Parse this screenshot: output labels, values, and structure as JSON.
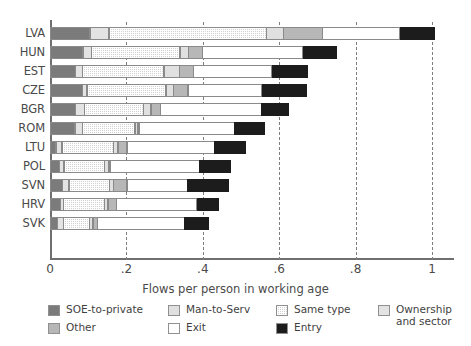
{
  "chart_data": {
    "type": "bar",
    "orientation": "horizontal",
    "stacked": true,
    "title": "",
    "xlabel": "Flows per person in working age",
    "ylabel": "",
    "xlim": [
      0,
      1.07
    ],
    "xticks": [
      0,
      0.2,
      0.4,
      0.6,
      0.8,
      1
    ],
    "xtick_labels": [
      "0",
      ".2",
      ".4",
      ".6",
      ".8",
      "1"
    ],
    "grid": "vertical-dashed",
    "legend_position": "below",
    "categories": [
      "LVA",
      "HUN",
      "EST",
      "CZE",
      "BGR",
      "ROM",
      "LTU",
      "POL",
      "SVN",
      "HRV",
      "SVK"
    ],
    "series": [
      {
        "name": "SOE-to-private",
        "color": "#7b7b7b",
        "values": [
          0.105,
          0.087,
          0.068,
          0.086,
          0.068,
          0.066,
          0.016,
          0.026,
          0.034,
          0.029,
          0.021
        ]
      },
      {
        "name": "Ownership and sector",
        "color": "#e3e3e3",
        "values": [
          0.052,
          0.024,
          0.019,
          0.013,
          0.024,
          0.021,
          0.018,
          0.013,
          0.018,
          0.008,
          0.016
        ]
      },
      {
        "name": "Same type",
        "color": "#d2d2d2",
        "values": [
          0.414,
          0.233,
          0.215,
          0.209,
          0.157,
          0.139,
          0.136,
          0.107,
          0.107,
          0.11,
          0.071
        ]
      },
      {
        "name": "Man-to-Serv",
        "color": "#e0e0e0",
        "values": [
          0.045,
          0.024,
          0.042,
          0.021,
          0.021,
          0.01,
          0.013,
          0.013,
          0.013,
          0.01,
          0.01
        ]
      },
      {
        "name": "Other",
        "color": "#b7b7b7",
        "values": [
          0.105,
          0.039,
          0.039,
          0.039,
          0.026,
          0.005,
          0.026,
          0.005,
          0.037,
          0.024,
          0.013
        ]
      },
      {
        "name": "Exit",
        "color": "#ffffff",
        "values": [
          0.204,
          0.264,
          0.207,
          0.196,
          0.267,
          0.251,
          0.23,
          0.236,
          0.16,
          0.212,
          0.23
        ]
      },
      {
        "name": "Entry",
        "color": "#1c1c1c",
        "values": [
          0.092,
          0.089,
          0.094,
          0.118,
          0.073,
          0.079,
          0.084,
          0.084,
          0.11,
          0.06,
          0.065
        ]
      }
    ],
    "totals": [
      1.017,
      0.76,
      0.684,
      0.682,
      0.636,
      0.571,
      0.523,
      0.484,
      0.479,
      0.453,
      0.426
    ]
  },
  "axis": {
    "x_title": "Flows per person in working age",
    "x_tick_labels": [
      "0",
      ".2",
      ".4",
      ".6",
      ".8",
      "1"
    ],
    "y_tick_labels": [
      "LVA",
      "HUN",
      "EST",
      "CZE",
      "BGR",
      "ROM",
      "LTU",
      "POL",
      "SVN",
      "HRV",
      "SVK"
    ]
  },
  "legend": {
    "items": [
      {
        "label": "SOE-to-private",
        "color": "#7b7b7b",
        "pattern": "solid"
      },
      {
        "label": "Other",
        "color": "#b7b7b7",
        "pattern": "solid"
      },
      {
        "label": "Man-to-Serv",
        "color": "#e0e0e0",
        "pattern": "solid"
      },
      {
        "label": "Exit",
        "color": "#ffffff",
        "pattern": "solid"
      },
      {
        "label": "Same type",
        "color": "#d2d2d2",
        "pattern": "checker"
      },
      {
        "label": "Entry",
        "color": "#1c1c1c",
        "pattern": "solid"
      },
      {
        "label": "Ownership and sector",
        "color": "#e3e3e3",
        "pattern": "solid",
        "line1": "Ownership",
        "line2": "and sector"
      }
    ]
  }
}
